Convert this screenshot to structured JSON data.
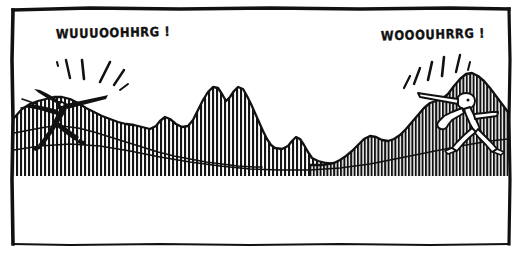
{
  "panel": {
    "title": "comic-panel",
    "medium": "pen-and-ink line drawing",
    "background_color": "#ffffff",
    "ink_color": "#111111",
    "border": {
      "name": "hand-drawn-panel-border",
      "style": "irregular hand-inked rectangle",
      "color": "#111111"
    }
  },
  "dialogue": {
    "left_shout": "WUUUOOHHRG !",
    "right_shout": "WOOOUHRRG !"
  },
  "characters": [
    {
      "id": "left-figure",
      "name": "bird-headed figure shouting right",
      "fill": "solid black silhouette",
      "beak_direction": "right",
      "pose": "striding, arms back, head raised"
    },
    {
      "id": "right-figure",
      "name": "bird-headed figure shouting left",
      "fill": "white outlined silhouette",
      "beak_direction": "left",
      "pose": "striding, arm raised, head forward"
    }
  ],
  "scenery": {
    "description": "two hatched hillsides facing each other across a wide empty valley",
    "hatching": "vertical pen strokes",
    "valley_floor": "blank white",
    "sky": "blank white"
  },
  "effects": {
    "left_shout_lines": 6,
    "right_shout_lines": 6,
    "effect_name": "radiating emphasis strokes"
  }
}
